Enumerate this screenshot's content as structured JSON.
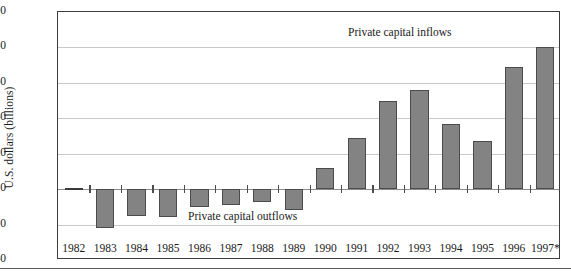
{
  "chart_data": {
    "type": "bar",
    "title": "",
    "xlabel": "",
    "ylabel": "U.S. dollars (billions)",
    "ylim": [
      -40,
      100
    ],
    "yticks": [
      100,
      80,
      60,
      40,
      20,
      0,
      -20,
      -40
    ],
    "ytick_labels": [
      "100",
      "80",
      "60",
      "40",
      "20",
      "0",
      "−20",
      "−40"
    ],
    "grid": true,
    "legend": "none",
    "categories": [
      "1982",
      "1983",
      "1984",
      "1985",
      "1986",
      "1987",
      "1988",
      "1989",
      "1990",
      "1991",
      "1992",
      "1993",
      "1994",
      "1995",
      "1996",
      "1997*"
    ],
    "values": [
      0,
      -22,
      -15,
      -16,
      -10,
      -9,
      -7,
      -12,
      12,
      29,
      50,
      56,
      37,
      27,
      69,
      80
    ],
    "annotations": [
      {
        "text": "Private capital inflows",
        "x": "1993",
        "y": 93
      },
      {
        "text": "Private capital outflows",
        "x": "1987",
        "y": -10
      }
    ],
    "colors": {
      "bar_fill": "#838383",
      "bar_edge": "#4b4b4b",
      "grid": "#c9c9c9",
      "axis": "#3c3c3c",
      "text": "#1a1a1a"
    }
  }
}
